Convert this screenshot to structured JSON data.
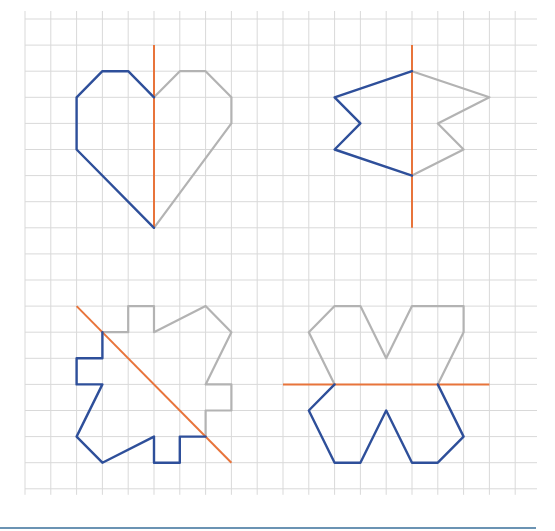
{
  "diagram": {
    "colors": {
      "grid": "#d9d9d9",
      "blue": "#2e4f9a",
      "grey": "#b3b3b3",
      "axis": "#e8743b",
      "bottom_rule": "#6b93b3"
    },
    "grid": {
      "x0": 25,
      "y0": 19,
      "dx": 25.8,
      "dy": 26.1,
      "cols": 20,
      "rows": 19,
      "right_edge": 537
    },
    "figures": [
      {
        "name": "heart",
        "axis": [
          [
            5,
            1
          ],
          [
            5,
            8
          ]
        ],
        "blue": [
          [
            5,
            3
          ],
          [
            4,
            2
          ],
          [
            3,
            2
          ],
          [
            2,
            3
          ],
          [
            2,
            5
          ],
          [
            5,
            8
          ]
        ],
        "grey": [
          [
            5,
            3
          ],
          [
            6,
            2
          ],
          [
            7,
            2
          ],
          [
            8,
            3
          ],
          [
            8,
            4
          ],
          [
            5,
            8
          ]
        ]
      },
      {
        "name": "flag",
        "axis": [
          [
            15,
            1
          ],
          [
            15,
            8
          ]
        ],
        "blue": [
          [
            15,
            2
          ],
          [
            12,
            3
          ],
          [
            13,
            4
          ],
          [
            12,
            5
          ],
          [
            15,
            6
          ]
        ],
        "grey": [
          [
            15,
            2
          ],
          [
            18,
            3
          ],
          [
            16,
            4
          ],
          [
            17,
            5
          ],
          [
            15,
            6
          ]
        ]
      },
      {
        "name": "diagonal-shape",
        "axis": [
          [
            2,
            11
          ],
          [
            8,
            17
          ]
        ],
        "blue": [
          [
            3,
            12
          ],
          [
            3,
            13
          ],
          [
            2,
            13
          ],
          [
            2,
            14
          ],
          [
            3,
            14
          ],
          [
            2,
            16
          ],
          [
            3,
            17
          ],
          [
            5,
            16
          ],
          [
            5,
            17
          ],
          [
            6,
            17
          ],
          [
            6,
            16
          ],
          [
            7,
            16
          ]
        ],
        "grey": [
          [
            3,
            12
          ],
          [
            4,
            12
          ],
          [
            4,
            11
          ],
          [
            5,
            11
          ],
          [
            5,
            12
          ],
          [
            7,
            11
          ],
          [
            8,
            12
          ],
          [
            7,
            14
          ],
          [
            8,
            14
          ],
          [
            8,
            15
          ],
          [
            7,
            15
          ],
          [
            7,
            16
          ]
        ]
      },
      {
        "name": "horizontal-shape",
        "axis": [
          [
            10,
            14
          ],
          [
            18,
            14
          ]
        ],
        "blue": [
          [
            12,
            14
          ],
          [
            11,
            15
          ],
          [
            12,
            17
          ],
          [
            13,
            17
          ],
          [
            14,
            15
          ],
          [
            15,
            17
          ],
          [
            16,
            17
          ],
          [
            17,
            16
          ],
          [
            16,
            14
          ]
        ],
        "grey": [
          [
            12,
            14
          ],
          [
            11,
            12
          ],
          [
            12,
            11
          ],
          [
            13,
            11
          ],
          [
            14,
            13
          ],
          [
            15,
            11
          ],
          [
            17,
            11
          ],
          [
            17,
            12
          ],
          [
            16,
            14
          ]
        ]
      }
    ]
  }
}
